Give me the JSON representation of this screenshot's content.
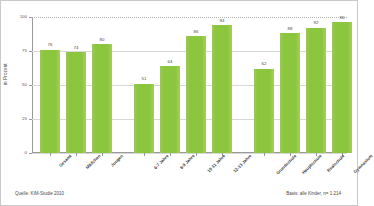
{
  "chart_data": {
    "type": "bar",
    "title": "",
    "xlabel": "",
    "ylabel": "in Prozent",
    "ylim": [
      0,
      100
    ],
    "yticks": [
      0,
      25,
      50,
      75,
      100
    ],
    "ytick_labels": [
      "0",
      "25",
      "50",
      "75",
      "100"
    ],
    "grid": true,
    "legend": "none",
    "bar_color": "#8CC63F",
    "groups": [
      {
        "name": "gesamt",
        "categories": [
          "Gesamt",
          "Mädchen",
          "Jungen"
        ],
        "values": [
          76,
          74,
          80
        ]
      },
      {
        "name": "alter",
        "categories": [
          "6-7 Jahre",
          "8-9 Jahre",
          "10-11 Jahre",
          "12-13 Jahre"
        ],
        "values": [
          51,
          64,
          86,
          94
        ]
      },
      {
        "name": "schule",
        "categories": [
          "Grundschule",
          "Hauptschule",
          "Realschule",
          "Gymnasium"
        ],
        "values": [
          62,
          88,
          92,
          96
        ]
      }
    ],
    "categories": [
      "Gesamt",
      "Mädchen",
      "Jungen",
      "6-7 Jahre",
      "8-9 Jahre",
      "10-11 Jahre",
      "12-13 Jahre",
      "Grundschule",
      "Hauptschule",
      "Realschule",
      "Gymnasium"
    ],
    "values": [
      76,
      74,
      80,
      51,
      64,
      86,
      94,
      62,
      88,
      92,
      96
    ]
  },
  "footer": {
    "source": "Quelle: KIM-Studie 2010",
    "basis": "Basis: alle Kinder, n= 1.214"
  }
}
